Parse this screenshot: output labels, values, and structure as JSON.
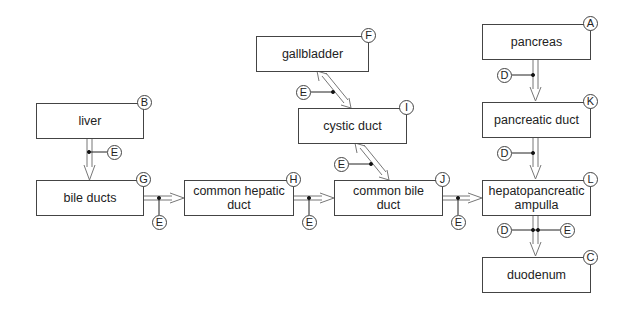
{
  "diagram": {
    "nodes": [
      {
        "id": "liver",
        "label": "liver",
        "badge": "B"
      },
      {
        "id": "bile-ducts",
        "label": "bile ducts",
        "badge": "G"
      },
      {
        "id": "common-hepatic-duct",
        "label": "common hepatic duct",
        "badge": "H"
      },
      {
        "id": "common-bile-duct",
        "label": "common bile duct",
        "badge": "J"
      },
      {
        "id": "gallbladder",
        "label": "gallbladder",
        "badge": "F"
      },
      {
        "id": "cystic-duct",
        "label": "cystic duct",
        "badge": "I"
      },
      {
        "id": "pancreas",
        "label": "pancreas",
        "badge": "A"
      },
      {
        "id": "pancreatic-duct",
        "label": "pancreatic duct",
        "badge": "K"
      },
      {
        "id": "hepatopancreatic-ampulla",
        "label": "hepatopancreatic ampulla",
        "badge": "L"
      },
      {
        "id": "duodenum",
        "label": "duodenum",
        "badge": "C"
      }
    ],
    "edges": [
      {
        "from": "liver",
        "to": "bile-ducts",
        "direction": "one-way",
        "markers": [
          "E"
        ]
      },
      {
        "from": "bile-ducts",
        "to": "common-hepatic-duct",
        "direction": "one-way",
        "markers": [
          "E"
        ]
      },
      {
        "from": "common-hepatic-duct",
        "to": "common-bile-duct",
        "direction": "one-way",
        "markers": [
          "E"
        ]
      },
      {
        "from": "gallbladder",
        "to": "cystic-duct",
        "direction": "two-way",
        "markers": [
          "E"
        ]
      },
      {
        "from": "cystic-duct",
        "to": "common-bile-duct",
        "direction": "two-way",
        "markers": [
          "E"
        ]
      },
      {
        "from": "common-bile-duct",
        "to": "hepatopancreatic-ampulla",
        "direction": "one-way",
        "markers": [
          "E"
        ]
      },
      {
        "from": "pancreas",
        "to": "pancreatic-duct",
        "direction": "one-way",
        "markers": [
          "D"
        ]
      },
      {
        "from": "pancreatic-duct",
        "to": "hepatopancreatic-ampulla",
        "direction": "one-way",
        "markers": [
          "D"
        ]
      },
      {
        "from": "hepatopancreatic-ampulla",
        "to": "duodenum",
        "direction": "one-way",
        "markers": [
          "D",
          "E"
        ]
      }
    ],
    "marker_labels": {
      "D": "D",
      "E": "E"
    }
  },
  "labels": {
    "liver": "liver",
    "bile_ducts": "bile ducts",
    "common_hepatic_duct_1": "common hepatic",
    "common_hepatic_duct_2": "duct",
    "common_bile_duct_1": "common bile",
    "common_bile_duct_2": "duct",
    "gallbladder": "gallbladder",
    "cystic_duct": "cystic duct",
    "pancreas": "pancreas",
    "pancreatic_duct": "pancreatic duct",
    "hepatopancreatic_ampulla_1": "hepatopancreatic",
    "hepatopancreatic_ampulla_2": "ampulla",
    "duodenum": "duodenum"
  },
  "badges": {
    "A": "A",
    "B": "B",
    "C": "C",
    "D": "D",
    "E": "E",
    "F": "F",
    "G": "G",
    "H": "H",
    "I": "I",
    "J": "J",
    "K": "K",
    "L": "L"
  }
}
